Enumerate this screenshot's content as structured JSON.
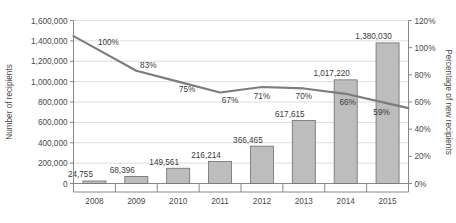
{
  "chart_data": {
    "type": "bar",
    "title": "",
    "xlabel": "",
    "ylabel": "Number of recipients",
    "y2label": "Percentage of new recipients",
    "categories": [
      "2008",
      "2009",
      "2010",
      "2011",
      "2012",
      "2013",
      "2014",
      "2015"
    ],
    "ylim": [
      0,
      1600000
    ],
    "y2lim": [
      0,
      1.2
    ],
    "grid": true,
    "legend": "none",
    "y_ticks": [
      "0",
      "200,000",
      "400,000",
      "600,000",
      "800,000",
      "1,000,000",
      "1,200,000",
      "1,400,000",
      "1,600,000"
    ],
    "y_tick_values": [
      0,
      200000,
      400000,
      600000,
      800000,
      1000000,
      1200000,
      1400000,
      1600000
    ],
    "y2_ticks": [
      "0%",
      "20%",
      "40%",
      "60%",
      "80%",
      "100%",
      "120%"
    ],
    "y2_tick_values": [
      0,
      20,
      40,
      60,
      80,
      100,
      120
    ],
    "series": [
      {
        "name": "Number of recipients",
        "type": "bar",
        "axis": "left",
        "color": "#bdbdbd",
        "values": [
          24755,
          68396,
          149561,
          216214,
          366465,
          617615,
          1017220,
          1380030
        ],
        "labels": [
          "24,755",
          "68,396",
          "149,561",
          "216,214",
          "366,465",
          "617,615",
          "1,017,220",
          "1,380,030"
        ]
      },
      {
        "name": "Percentage of new recipients",
        "type": "line",
        "axis": "right",
        "color": "#7c7c7c",
        "values": [
          100,
          83,
          75,
          67,
          71,
          70,
          66,
          59
        ],
        "labels": [
          "100%",
          "83%",
          "75%",
          "67%",
          "71%",
          "70%",
          "66%",
          "59%"
        ]
      }
    ]
  }
}
